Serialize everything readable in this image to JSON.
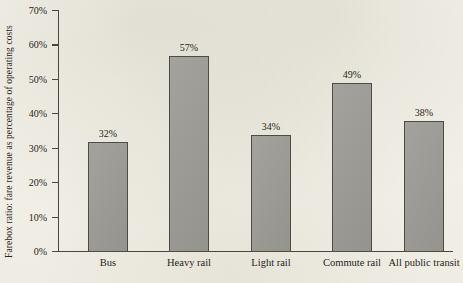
{
  "chart_data": {
    "type": "bar",
    "title": "",
    "subtitle": "",
    "xlabel": "",
    "ylabel": "Farebox ratio: fare revenue as percentage of operating costs",
    "categories": [
      "Bus",
      "Heavy rail",
      "Light rail",
      "Commute rail",
      "All public transit"
    ],
    "values": [
      32,
      57,
      34,
      49,
      38
    ],
    "value_labels": [
      "32%",
      "57%",
      "34%",
      "49%",
      "38%"
    ],
    "ylim": [
      0,
      70
    ],
    "ytick_values": [
      0,
      10,
      20,
      30,
      40,
      50,
      60,
      70
    ],
    "ytick_labels": [
      "0%",
      "10%",
      "20%",
      "30%",
      "40%",
      "50%",
      "60%",
      "70%"
    ],
    "grid": false,
    "legend": null,
    "legend_position": "none",
    "units": "percent",
    "series": [
      {
        "name": "Farebox ratio",
        "values": [
          32,
          57,
          34,
          49,
          38
        ]
      }
    ],
    "annotations": []
  },
  "style": {
    "paper_color": "#f2f0e8",
    "bar_fill": "#9c9b95",
    "bar_edge": "#4f4c45",
    "axis_color": "#4a4740",
    "text_color": "#262420"
  }
}
